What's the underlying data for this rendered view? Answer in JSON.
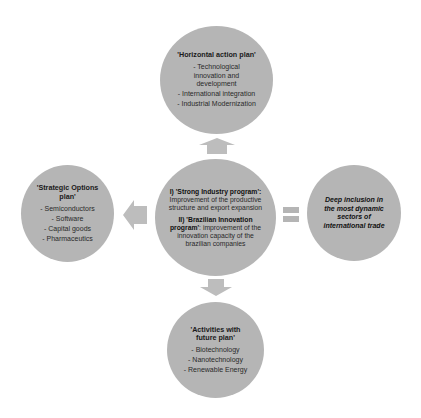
{
  "colors": {
    "circle_fill": "#b5b5b5",
    "arrow_fill": "#bdbdbd",
    "text": "#1a1a1a"
  },
  "top": {
    "title": "'Horizontal action plan'",
    "items": [
      "- Technological innovation and development",
      "- International integration",
      "- Industrial Modernization"
    ]
  },
  "left": {
    "title": "'Strategic Options plan'",
    "items": [
      "- Semiconductors",
      "- Software",
      "- Capital goods",
      "- Pharmaceutics"
    ]
  },
  "center": {
    "p1_bold": "I) 'Strong Industry program':",
    "p1_text": "Improvement of the productive structure and export expansion",
    "p2_bold": "II) 'Brazilian Innovation program'",
    "p2_text": ": improvement of the innovation capacity of the brazilian companies"
  },
  "right": {
    "text": "Deep inclusion in the most dynamic sectors of international trade"
  },
  "bottom": {
    "title": "'Activities with future plan'",
    "items": [
      "- Biotechnology",
      "- Nanotechnology",
      "- Renewable Energy"
    ]
  },
  "connectors": {
    "up": "arrow-up",
    "left": "arrow-left",
    "down": "arrow-down",
    "right": "equals-sign"
  }
}
